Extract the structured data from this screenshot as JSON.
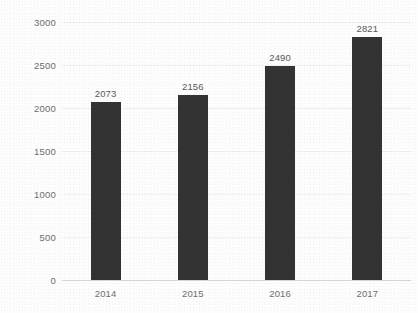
{
  "chart_data": {
    "type": "bar",
    "title": "",
    "subtitle": "",
    "xlabel": "",
    "ylabel": "",
    "categories": [
      "2014",
      "2015",
      "2016",
      "2017"
    ],
    "values": [
      2073,
      2156,
      2490,
      2821
    ],
    "data_labels": [
      "2073",
      "2156",
      "2490",
      "2821"
    ],
    "ylim": [
      0,
      3000
    ],
    "ytick_values": [
      0,
      500,
      1000,
      1500,
      2000,
      2500,
      3000
    ],
    "ytick_labels": [
      "0",
      "500",
      "1000",
      "1500",
      "2000",
      "2500",
      "3000"
    ],
    "grid": "horizontal",
    "legend": "none",
    "series": [
      {
        "name": "",
        "values": [
          2073,
          2156,
          2490,
          2821
        ]
      }
    ],
    "colors": {
      "bar": "#333333",
      "background": "#fdfdfd",
      "gridline": "#f0f0f0",
      "axis": "#d8d8d8",
      "tick_text": "#6e6e6e",
      "label_text": "#5a5a5a"
    }
  }
}
